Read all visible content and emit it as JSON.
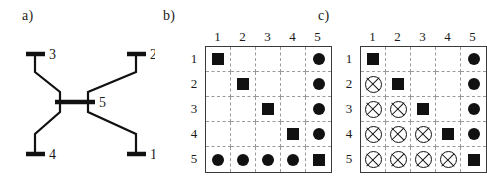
{
  "figure": {
    "background": "#ffffff",
    "ink": "#111111",
    "gridline_color": "#9a9a9a",
    "border_color": "#3a3a3a"
  },
  "panels": {
    "a": {
      "label": "a)",
      "type": "network-diagram",
      "description": "Five-node star/crossbar network: four peripheral terminals (1,2,3,4) connected through a central common node 5",
      "nodes": [
        {
          "id": "1",
          "label": "1",
          "position": "bottom-right"
        },
        {
          "id": "2",
          "label": "2",
          "position": "top-right"
        },
        {
          "id": "3",
          "label": "3",
          "position": "top-left"
        },
        {
          "id": "4",
          "label": "4",
          "position": "bottom-left"
        },
        {
          "id": "5",
          "label": "5",
          "position": "center"
        }
      ],
      "edges": [
        {
          "from": "3",
          "to": "5"
        },
        {
          "from": "2",
          "to": "5"
        },
        {
          "from": "4",
          "to": "5"
        },
        {
          "from": "1",
          "to": "5"
        }
      ]
    },
    "b": {
      "label": "b)",
      "col_headers": [
        "1",
        "2",
        "3",
        "4",
        "5"
      ],
      "row_headers": [
        "1",
        "2",
        "3",
        "4",
        "5"
      ],
      "cells": [
        [
          "square",
          "empty",
          "empty",
          "empty",
          "circle"
        ],
        [
          "empty",
          "square",
          "empty",
          "empty",
          "circle"
        ],
        [
          "empty",
          "empty",
          "square",
          "empty",
          "circle"
        ],
        [
          "empty",
          "empty",
          "empty",
          "square",
          "circle"
        ],
        [
          "circle",
          "circle",
          "circle",
          "circle",
          "square"
        ]
      ]
    },
    "c": {
      "label": "c)",
      "col_headers": [
        "1",
        "2",
        "3",
        "4",
        "5"
      ],
      "row_headers": [
        "1",
        "2",
        "3",
        "4",
        "5"
      ],
      "cells": [
        [
          "square",
          "empty",
          "empty",
          "empty",
          "circle"
        ],
        [
          "xcircle",
          "square",
          "empty",
          "empty",
          "circle"
        ],
        [
          "xcircle",
          "xcircle",
          "square",
          "empty",
          "circle"
        ],
        [
          "xcircle",
          "xcircle",
          "xcircle",
          "square",
          "circle"
        ],
        [
          "xcircle",
          "xcircle",
          "xcircle",
          "xcircle",
          "square"
        ]
      ]
    }
  },
  "legend_symbols": {
    "square": "filled-square",
    "circle": "filled-circle",
    "xcircle": "crossed-circle",
    "empty": "empty-cell"
  }
}
